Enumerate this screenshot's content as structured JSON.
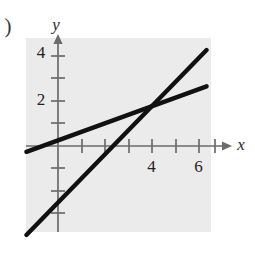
{
  "figure": {
    "item_label": ")",
    "background_color": "#ebebeb",
    "line_color": "#111111",
    "axis_color": "#6b6b6b",
    "text_color": "#232323"
  },
  "chart_data": {
    "type": "line",
    "title": "",
    "xlabel": "x",
    "ylabel": "y",
    "xlim": [
      -1.35,
      7.0
    ],
    "ylim": [
      -4.5,
      4.5
    ],
    "grid": false,
    "legend": "none",
    "x_ticks": [
      1,
      2,
      3,
      4,
      5,
      6,
      7
    ],
    "x_tick_labels": [
      "",
      "",
      "",
      "4",
      "",
      "6",
      ""
    ],
    "y_ticks": [
      -3,
      -2,
      -1,
      1,
      2,
      3,
      4
    ],
    "y_tick_labels": [
      "",
      "",
      "",
      "",
      "2",
      "",
      "4"
    ],
    "series": [
      {
        "name": "steep-line",
        "slope": 1,
        "intercept": -1,
        "x_start": -1.35,
        "x_end": 6.35,
        "y_start": -3.8,
        "y_end": 4.1
      },
      {
        "name": "shallow-line",
        "slope": 0.36,
        "intercept": 0.54,
        "x_start": -1.35,
        "x_end": 6.35,
        "y_start": -0.25,
        "y_end": 2.55
      }
    ],
    "intersection": {
      "x": 4.25,
      "y": 1.9
    }
  }
}
